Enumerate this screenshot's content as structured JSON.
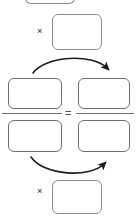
{
  "diagram": {
    "type": "cross-multiplication-proportion",
    "canvas": {
      "width": 136,
      "height": 219
    },
    "colors": {
      "box_border": "#6e7174",
      "box_border_light": "#8b9093",
      "box_fill": "#ffffff",
      "arrow": "#1c1c1c",
      "symbol": "#1c1c1c",
      "background": "#ffffff"
    },
    "symbols": {
      "multiply_top": "×",
      "multiply_bottom": "×",
      "equals": "=",
      "fraction_bar_left": "",
      "fraction_bar_right": ""
    },
    "boxes": [
      {
        "id": "top-partial-box",
        "label": "",
        "value": ""
      },
      {
        "id": "top-multiplier-box",
        "label": "",
        "value": ""
      },
      {
        "id": "numerator-left-box",
        "label": "",
        "value": ""
      },
      {
        "id": "numerator-right-box",
        "label": "",
        "value": ""
      },
      {
        "id": "denominator-left-box",
        "label": "",
        "value": ""
      },
      {
        "id": "denominator-right-box",
        "label": "",
        "value": ""
      },
      {
        "id": "bottom-multiplier-box",
        "label": "",
        "value": ""
      }
    ],
    "arrows": [
      {
        "id": "top-cross-arrow",
        "direction": "left-to-right",
        "curve": "arc-over",
        "head": "right"
      },
      {
        "id": "bottom-cross-arrow",
        "direction": "left-to-right",
        "curve": "arc-under",
        "head": "right"
      }
    ]
  }
}
